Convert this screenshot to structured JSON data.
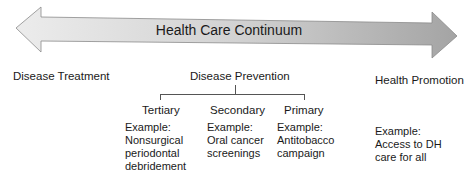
{
  "diagram": {
    "title": "Health Care Continuum",
    "continuum_labels": {
      "left": "Disease Treatment",
      "middle": "Disease Prevention",
      "right": "Health Promotion"
    },
    "prevention_levels": [
      {
        "level": "Tertiary",
        "example_label": "Example:",
        "example": "Nonsurgical periodontal debridement"
      },
      {
        "level": "Secondary",
        "example_label": "Example:",
        "example": "Oral cancer screenings"
      },
      {
        "level": "Primary",
        "example_label": "Example:",
        "example": "Antitobacco campaign"
      }
    ],
    "promotion_example": {
      "example_label": "Example:",
      "example": "Access to DH care for all"
    },
    "colors": {
      "arrow_light": "#e6e6e6",
      "arrow_dark": "#a9a9a9",
      "arrow_stroke": "#8a8a8a",
      "text": "#1a1a1a"
    }
  }
}
